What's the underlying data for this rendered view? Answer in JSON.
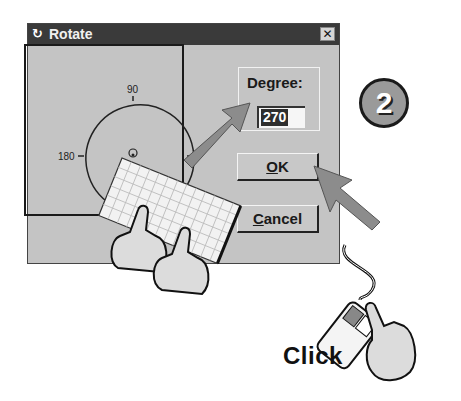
{
  "window": {
    "title": "Rotate",
    "title_icon": "rotate-app-icon",
    "close_label": "✕"
  },
  "dial": {
    "labels": {
      "top": "90",
      "left": "180",
      "right": "0"
    }
  },
  "degree": {
    "label": "Degree:",
    "value": "270"
  },
  "buttons": {
    "ok": {
      "mnemonic": "O",
      "rest": "K"
    },
    "cancel": {
      "mnemonic": "C",
      "rest": "ancel"
    }
  },
  "instruction": {
    "step_number": "2",
    "action_label": "Click"
  },
  "colors": {
    "dialog_bg": "#c4c4c4",
    "titlebar_bg": "#3a3a3a",
    "arrow": "#8c8c8c",
    "highlight": "#2e2e2e"
  }
}
